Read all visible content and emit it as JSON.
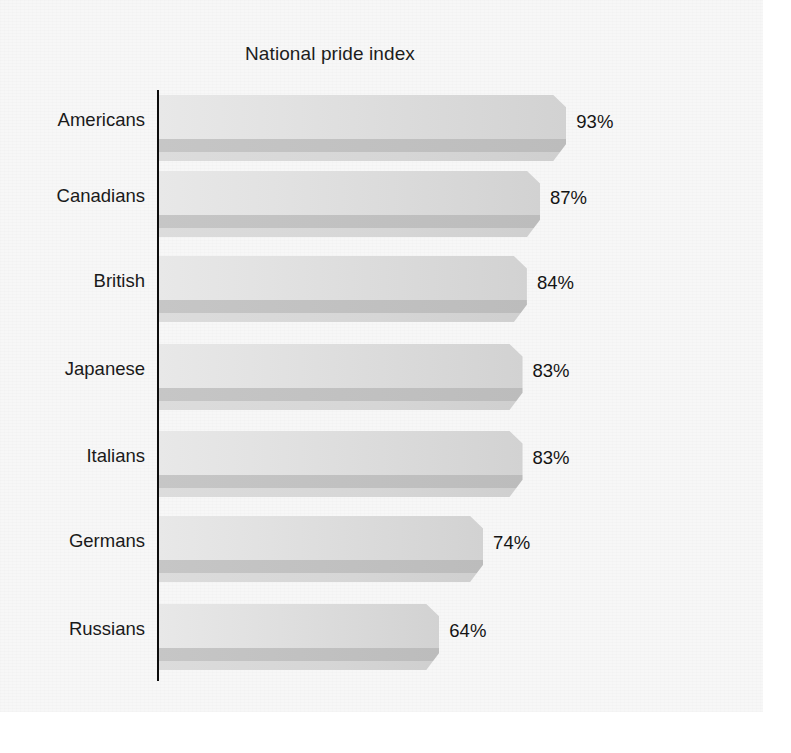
{
  "chart_data": {
    "type": "bar",
    "orientation": "horizontal",
    "title": "National pride index",
    "xlabel": "",
    "ylabel": "",
    "categories": [
      "Americans",
      "Canadians",
      "British",
      "Japanese",
      "Italians",
      "Germans",
      "Russians"
    ],
    "values": [
      93,
      87,
      84,
      83,
      83,
      74,
      64
    ],
    "value_labels": [
      "93%",
      "87%",
      "84%",
      "83%",
      "83%",
      "74%",
      "64%"
    ],
    "unit": "%",
    "xlim": [
      0,
      100
    ],
    "grid": false,
    "legend": null,
    "axis_line": "vertical-left",
    "style": "grayscale-3d-beveled-bars",
    "colors": {
      "bar_face_light": "#e8e8e8",
      "bar_face_dark": "#d2d2d2",
      "bar_shadow": "#c2c2c2",
      "axis": "#0d0d0d",
      "text": "#1a1a1a",
      "background": "#f7f7f7"
    }
  },
  "chart": {
    "title": "National pride index",
    "bars": [
      {
        "label": "Americans",
        "value": 93,
        "value_label": "93%"
      },
      {
        "label": "Canadians",
        "value": 87,
        "value_label": "87%"
      },
      {
        "label": "British",
        "value": 84,
        "value_label": "84%"
      },
      {
        "label": "Japanese",
        "value": 83,
        "value_label": "83%"
      },
      {
        "label": "Italians",
        "value": 83,
        "value_label": "83%"
      },
      {
        "label": "Germans",
        "value": 74,
        "value_label": "74%"
      },
      {
        "label": "Russians",
        "value": 64,
        "value_label": "64%"
      }
    ]
  }
}
